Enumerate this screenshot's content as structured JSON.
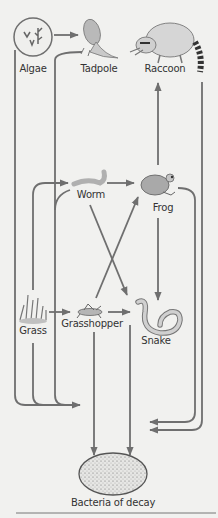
{
  "diagram": {
    "type": "food-web",
    "colors": {
      "line": "#6f6f6f",
      "organism_fill": "#b9b9b9",
      "background": "#f1f1ef",
      "text": "#333333"
    },
    "nodes": [
      {
        "id": "algae",
        "label": "Algae",
        "icon": "algae-icon"
      },
      {
        "id": "tadpole",
        "label": "Tadpole",
        "icon": "tadpole-icon"
      },
      {
        "id": "raccoon",
        "label": "Raccoon",
        "icon": "raccoon-icon"
      },
      {
        "id": "worm",
        "label": "Worm",
        "icon": "worm-icon"
      },
      {
        "id": "frog",
        "label": "Frog",
        "icon": "frog-icon"
      },
      {
        "id": "grass",
        "label": "Grass",
        "icon": "grass-icon"
      },
      {
        "id": "grasshopper",
        "label": "Grasshopper",
        "icon": "grasshopper-icon"
      },
      {
        "id": "snake",
        "label": "Snake",
        "icon": "snake-icon"
      },
      {
        "id": "bacteria",
        "label": "Bacteria of decay",
        "icon": "bacteria-icon"
      }
    ],
    "edges": [
      {
        "from": "algae",
        "to": "tadpole"
      },
      {
        "from": "tadpole",
        "to": "raccoon"
      },
      {
        "from": "frog",
        "to": "raccoon"
      },
      {
        "from": "worm",
        "to": "frog"
      },
      {
        "from": "grass",
        "to": "worm"
      },
      {
        "from": "grass",
        "to": "grasshopper"
      },
      {
        "from": "grasshopper",
        "to": "frog"
      },
      {
        "from": "worm",
        "to": "snake"
      },
      {
        "from": "grasshopper",
        "to": "snake"
      },
      {
        "from": "frog",
        "to": "snake"
      },
      {
        "from": "algae",
        "to": "bacteria"
      },
      {
        "from": "tadpole",
        "to": "bacteria"
      },
      {
        "from": "grass",
        "to": "bacteria"
      },
      {
        "from": "worm",
        "to": "bacteria"
      },
      {
        "from": "grasshopper",
        "to": "bacteria"
      },
      {
        "from": "snake",
        "to": "bacteria"
      },
      {
        "from": "frog",
        "to": "bacteria"
      },
      {
        "from": "raccoon",
        "to": "bacteria"
      }
    ]
  }
}
